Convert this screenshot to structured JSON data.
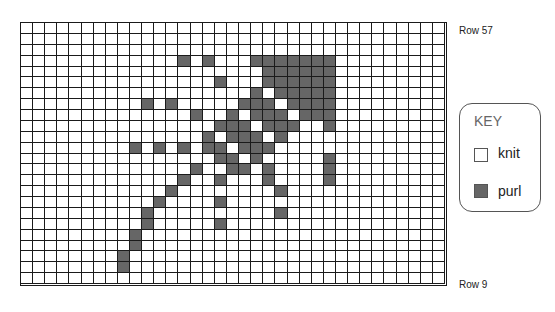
{
  "chart": {
    "columns": 35,
    "rows": 24,
    "colors": {
      "knit": "#ffffff",
      "purl": "#666666",
      "grid_line": "#1a1a1a"
    },
    "purl_cells": {
      "3": [
        13,
        15,
        19,
        20,
        21,
        22,
        23,
        24,
        25
      ],
      "4": [
        20,
        21,
        22,
        23,
        24,
        25
      ],
      "5": [
        16,
        20,
        21,
        22,
        23,
        24,
        25
      ],
      "6": [
        19,
        21,
        22,
        23,
        24,
        25
      ],
      "7": [
        10,
        12,
        18,
        19,
        20,
        22,
        23,
        24,
        25
      ],
      "8": [
        14,
        17,
        19,
        20,
        21,
        23,
        24,
        25
      ],
      "9": [
        16,
        17,
        18,
        20,
        21,
        22,
        25
      ],
      "10": [
        15,
        17,
        18,
        19,
        21
      ],
      "11": [
        9,
        11,
        13,
        15,
        16,
        18,
        19,
        20
      ],
      "12": [
        16,
        17,
        19,
        25
      ],
      "13": [
        14,
        17,
        18,
        20,
        25
      ],
      "14": [
        13,
        16,
        20,
        25
      ],
      "15": [
        12,
        21
      ],
      "16": [
        11,
        16
      ],
      "17": [
        10,
        21
      ],
      "18": [
        10,
        16
      ],
      "19": [
        9
      ],
      "20": [
        9
      ],
      "21": [
        8
      ],
      "22": [
        8
      ]
    }
  },
  "labels": {
    "row_top": "Row 57",
    "row_bottom": "Row 9"
  },
  "key": {
    "title": "KEY",
    "items": [
      {
        "label": "knit",
        "swatch": "knit"
      },
      {
        "label": "purl",
        "swatch": "purl"
      }
    ]
  }
}
